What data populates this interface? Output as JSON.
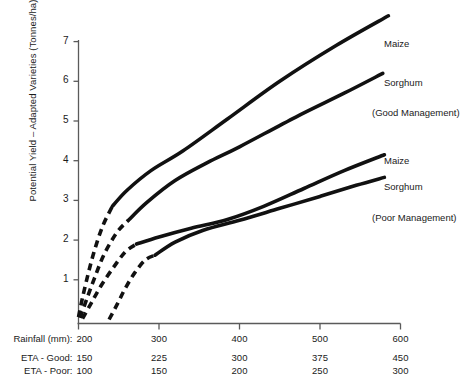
{
  "chart_data": {
    "type": "line",
    "title": "",
    "xlabel": "Rainfall (mm)",
    "ylabel": "Potential Yield – Adapted Varieties (Tonnes/ha)",
    "xlim": [
      200,
      600
    ],
    "ylim": [
      0,
      7.4
    ],
    "grid": false,
    "legend_position": "right-inline-labels",
    "axes": {
      "y_ticks": [
        1,
        2,
        3,
        4,
        5,
        6,
        7
      ],
      "x_axis_rows": [
        {
          "name": "rainfall",
          "label": "Rainfall (mm):",
          "first_value": "200",
          "values": [
            "200",
            "300",
            "400",
            "500",
            "600"
          ]
        },
        {
          "name": "eta-good",
          "label": "ETA - Good:",
          "first_value": "150",
          "values": [
            "150",
            "225",
            "300",
            "375",
            "450"
          ]
        },
        {
          "name": "eta-poor",
          "label": "ETA - Poor:",
          "first_value": "100",
          "values": [
            "100",
            "150",
            "200",
            "250",
            "300"
          ]
        }
      ]
    },
    "series": [
      {
        "name": "Maize (Good Management)",
        "label": "Maize",
        "group": "Good Management",
        "dashed_segment": [
          {
            "x": 200,
            "y": 0.06
          },
          {
            "x": 205,
            "y": 0.55
          },
          {
            "x": 212,
            "y": 1.15
          },
          {
            "x": 220,
            "y": 1.75
          },
          {
            "x": 230,
            "y": 2.35
          },
          {
            "x": 242,
            "y": 2.85
          }
        ],
        "solid_segment": [
          {
            "x": 242,
            "y": 2.85
          },
          {
            "x": 260,
            "y": 3.25
          },
          {
            "x": 290,
            "y": 3.75
          },
          {
            "x": 330,
            "y": 4.25
          },
          {
            "x": 385,
            "y": 5.05
          },
          {
            "x": 450,
            "y": 6.0
          },
          {
            "x": 520,
            "y": 6.9
          },
          {
            "x": 585,
            "y": 7.65
          }
        ]
      },
      {
        "name": "Sorghum (Good Management)",
        "label": "Sorghum",
        "group": "Good Management",
        "dashed_segment": [
          {
            "x": 202,
            "y": 0.04
          },
          {
            "x": 210,
            "y": 0.5
          },
          {
            "x": 220,
            "y": 1.05
          },
          {
            "x": 232,
            "y": 1.65
          },
          {
            "x": 248,
            "y": 2.2
          },
          {
            "x": 262,
            "y": 2.5
          }
        ],
        "solid_segment": [
          {
            "x": 262,
            "y": 2.5
          },
          {
            "x": 285,
            "y": 2.95
          },
          {
            "x": 320,
            "y": 3.5
          },
          {
            "x": 360,
            "y": 3.95
          },
          {
            "x": 400,
            "y": 4.35
          },
          {
            "x": 470,
            "y": 5.1
          },
          {
            "x": 530,
            "y": 5.7
          },
          {
            "x": 578,
            "y": 6.2
          }
        ]
      },
      {
        "name": "Maize (Poor Management)",
        "label": "Maize",
        "group": "Poor Management",
        "dashed_segment": [
          {
            "x": 205,
            "y": 0.02
          },
          {
            "x": 216,
            "y": 0.42
          },
          {
            "x": 228,
            "y": 0.85
          },
          {
            "x": 243,
            "y": 1.3
          },
          {
            "x": 258,
            "y": 1.7
          },
          {
            "x": 272,
            "y": 1.9
          }
        ],
        "solid_segment": [
          {
            "x": 272,
            "y": 1.9
          },
          {
            "x": 300,
            "y": 2.08
          },
          {
            "x": 340,
            "y": 2.3
          },
          {
            "x": 385,
            "y": 2.52
          },
          {
            "x": 430,
            "y": 2.85
          },
          {
            "x": 480,
            "y": 3.3
          },
          {
            "x": 530,
            "y": 3.75
          },
          {
            "x": 580,
            "y": 4.15
          }
        ]
      },
      {
        "name": "Sorghum (Poor Management)",
        "label": "Sorghum",
        "group": "Poor Management",
        "dashed_segment": [
          {
            "x": 238,
            "y": 0.0
          },
          {
            "x": 248,
            "y": 0.38
          },
          {
            "x": 258,
            "y": 0.78
          },
          {
            "x": 270,
            "y": 1.18
          },
          {
            "x": 283,
            "y": 1.5
          },
          {
            "x": 295,
            "y": 1.62
          }
        ],
        "solid_segment": [
          {
            "x": 295,
            "y": 1.62
          },
          {
            "x": 320,
            "y": 1.95
          },
          {
            "x": 355,
            "y": 2.25
          },
          {
            "x": 400,
            "y": 2.5
          },
          {
            "x": 450,
            "y": 2.8
          },
          {
            "x": 500,
            "y": 3.1
          },
          {
            "x": 545,
            "y": 3.38
          },
          {
            "x": 580,
            "y": 3.58
          }
        ]
      }
    ],
    "annotations": [
      {
        "name": "maize-good",
        "text": "Maize",
        "x_px": 384,
        "y_px": 38
      },
      {
        "name": "sorghum-good",
        "text": "Sorghum",
        "x_px": 384,
        "y_px": 77
      },
      {
        "name": "good-management",
        "text": "(Good Management)",
        "x_px": 372,
        "y_px": 107
      },
      {
        "name": "maize-poor",
        "text": "Maize",
        "x_px": 384,
        "y_px": 155
      },
      {
        "name": "sorghum-poor",
        "text": "Sorghum",
        "x_px": 384,
        "y_px": 181
      },
      {
        "name": "poor-management",
        "text": "(Poor Management)",
        "x_px": 372,
        "y_px": 212
      }
    ],
    "style": {
      "line_color": "#111111",
      "axis_color": "#555555",
      "background": "#ffffff"
    }
  }
}
